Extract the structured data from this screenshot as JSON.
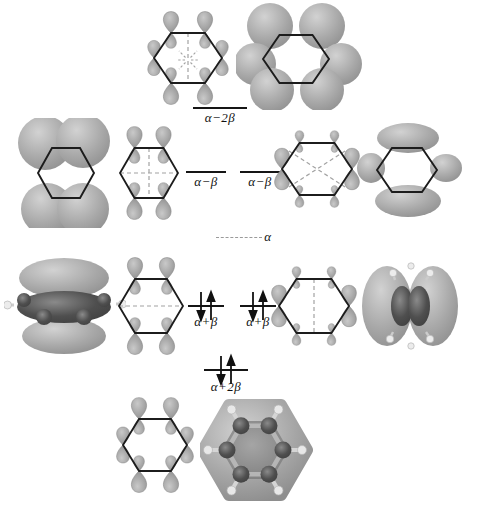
{
  "diagram": {
    "kind": "molecular-orbital-energy-diagram",
    "levels": [
      {
        "name": "alpha-minus-2beta",
        "label": "α−2β",
        "electrons": 0,
        "dashed": false
      },
      {
        "name": "alpha-minus-beta-left",
        "label": "α−β",
        "electrons": 0,
        "dashed": false
      },
      {
        "name": "alpha-minus-beta-right",
        "label": "α−β",
        "electrons": 0,
        "dashed": false
      },
      {
        "name": "alpha-reference",
        "label": "α",
        "electrons": 0,
        "dashed": true
      },
      {
        "name": "alpha-plus-beta-left",
        "label": "α+β",
        "electrons": 2,
        "dashed": false
      },
      {
        "name": "alpha-plus-beta-right",
        "label": "α+β",
        "electrons": 2,
        "dashed": false
      },
      {
        "name": "alpha-plus-2beta",
        "label": "α+2β",
        "electrons": 2,
        "dashed": false
      }
    ],
    "electron_arrows": [
      "down",
      "up"
    ],
    "orbital_icons": [
      "schematic-orbital-psi6",
      "isosurface-orbital-psi6",
      "isosurface-orbital-psi4",
      "schematic-orbital-psi4",
      "schematic-orbital-psi5",
      "isosurface-orbital-psi5",
      "isosurface-orbital-psi2",
      "schematic-orbital-psi2",
      "schematic-orbital-psi3",
      "isosurface-orbital-psi3",
      "schematic-orbital-psi1",
      "isosurface-orbital-psi1"
    ],
    "colors": {
      "background": "#ffffff",
      "lobe_gray": "#9b9b9b",
      "dark_lobe": "#4f4f4f",
      "hexagon_stroke": "#1c1c1c",
      "level_line": "#151515",
      "dashed_node": "#a2a2a2",
      "label_text": "#111111"
    }
  }
}
